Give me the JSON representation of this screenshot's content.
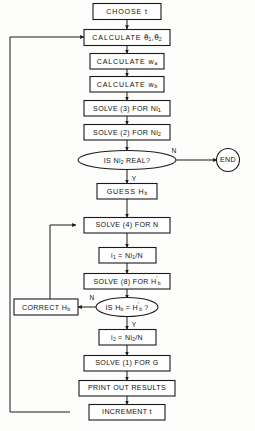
{
  "diagram": {
    "type": "flowchart",
    "title": "",
    "orientation": "top-to-bottom",
    "background_color": "#fdfdfc",
    "line_color": "#1a1a1a",
    "node_fill": "#ffffff",
    "nodes": [
      {
        "id": "choose_t",
        "shape": "rect",
        "label": "CHOOSE t",
        "x": 127,
        "y": 11
      },
      {
        "id": "calc_theta",
        "shape": "rect",
        "label": "CALCULATE θ1,θ2",
        "x": 127,
        "y": 37
      },
      {
        "id": "calc_wa",
        "shape": "rect",
        "label": "CALCULATE wa",
        "x": 127,
        "y": 61
      },
      {
        "id": "calc_wb",
        "shape": "rect",
        "label": "CALCULATE wb",
        "x": 127,
        "y": 84
      },
      {
        "id": "solve3",
        "shape": "rect",
        "label": "SOLVE (3) FOR Ni1",
        "x": 127,
        "y": 108
      },
      {
        "id": "solve2",
        "shape": "rect",
        "label": "SOLVE (2) FOR Ni2",
        "x": 127,
        "y": 132
      },
      {
        "id": "is_ni2_real",
        "shape": "ellipse",
        "label": "IS Ni2 REAL?",
        "x": 127,
        "y": 160
      },
      {
        "id": "end",
        "shape": "circle",
        "label": "END",
        "x": 228,
        "y": 160
      },
      {
        "id": "guess_hb",
        "shape": "rect",
        "label": "GUESS Hb",
        "x": 127,
        "y": 191
      },
      {
        "id": "solve4",
        "shape": "rect",
        "label": "SOLVE (4) FOR N",
        "x": 127,
        "y": 225
      },
      {
        "id": "i1_eq",
        "shape": "rect",
        "label": "i1 = Ni1/N",
        "x": 127,
        "y": 255
      },
      {
        "id": "solve8",
        "shape": "rect",
        "label": "SOLVE (8) FOR Hb'",
        "x": 127,
        "y": 281
      },
      {
        "id": "is_hb_eq",
        "shape": "ellipse",
        "label": "IS Hb = Hb' ?",
        "x": 127,
        "y": 307
      },
      {
        "id": "correct_hb",
        "shape": "rect",
        "label": "CORRECT Hb",
        "x": 50,
        "y": 307
      },
      {
        "id": "i2_eq",
        "shape": "rect",
        "label": "i2 = Ni2/N",
        "x": 127,
        "y": 337
      },
      {
        "id": "solve1",
        "shape": "rect",
        "label": "SOLVE (1) FOR G",
        "x": 127,
        "y": 363
      },
      {
        "id": "print_out",
        "shape": "rect",
        "label": "PRINT OUT RESULTS",
        "x": 127,
        "y": 388
      },
      {
        "id": "increment_t",
        "shape": "rect",
        "label": "INCREMENT t",
        "x": 127,
        "y": 412
      }
    ],
    "edge_labels": [
      {
        "id": "n_branch_real",
        "text": "N",
        "x": 174,
        "y": 151
      },
      {
        "id": "y_branch_real",
        "text": "Y",
        "x": 134,
        "y": 179
      },
      {
        "id": "n_branch_hb",
        "text": "N",
        "x": 92,
        "y": 298
      },
      {
        "id": "y_branch_hb",
        "text": "Y",
        "x": 134,
        "y": 325
      }
    ],
    "loops": [
      {
        "id": "outer-loop",
        "from": "increment_t",
        "to": "calc_theta",
        "side": "left",
        "x": 10
      },
      {
        "id": "inner-loop",
        "from": "correct_hb",
        "to": "solve4",
        "side": "left",
        "x": 53
      }
    ]
  }
}
